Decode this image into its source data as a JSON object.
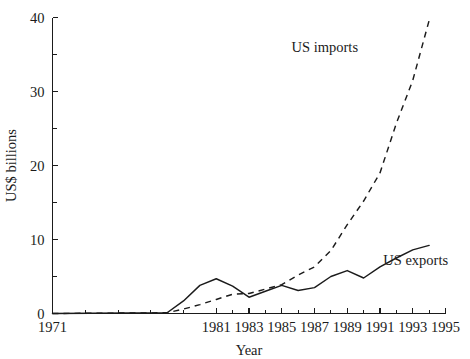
{
  "chart_data": {
    "type": "line",
    "title": "",
    "xlabel": "Year",
    "ylabel": "US$ billions",
    "xlim": [
      1971,
      1995
    ],
    "ylim": [
      0,
      40
    ],
    "grid": false,
    "legend_position": "inline-annotations",
    "x_ticks": [
      {
        "value": 1971,
        "label": "1971"
      },
      {
        "value": 1981,
        "label": "1981"
      },
      {
        "value": 1983,
        "label": "1983"
      },
      {
        "value": 1985,
        "label": "1985"
      },
      {
        "value": 1987,
        "label": "1987"
      },
      {
        "value": 1989,
        "label": "1989"
      },
      {
        "value": 1991,
        "label": "1991"
      },
      {
        "value": 1993,
        "label": "1993"
      },
      {
        "value": 1995,
        "label": "1995"
      }
    ],
    "x_minor_ticks": [
      1973,
      1975,
      1977,
      1979,
      1982,
      1984,
      1986,
      1988,
      1990,
      1992,
      1994
    ],
    "y_ticks": [
      {
        "value": 0,
        "label": "0"
      },
      {
        "value": 10,
        "label": "10"
      },
      {
        "value": 20,
        "label": "20"
      },
      {
        "value": 30,
        "label": "30"
      },
      {
        "value": 40,
        "label": "40"
      }
    ],
    "y_minor_ticks": [
      5,
      15,
      25,
      35
    ],
    "series": [
      {
        "name": "US imports",
        "style": "dashed",
        "color": "#1b1b1b",
        "label_text": "US imports",
        "label_x": 1985.6,
        "label_y": 35.4,
        "x": [
          1971,
          1978,
          1979,
          1980,
          1981,
          1982,
          1983,
          1984,
          1985,
          1986,
          1987,
          1988,
          1989,
          1990,
          1991,
          1992,
          1993,
          1994
        ],
        "values": [
          0,
          0.1,
          0.6,
          1.2,
          1.9,
          2.6,
          2.7,
          3.3,
          3.9,
          5.2,
          6.3,
          8.5,
          12.0,
          15.2,
          19.0,
          25.7,
          31.5,
          39.6
        ]
      },
      {
        "name": "US exports",
        "style": "solid",
        "color": "#1b1b1b",
        "label_text": "US exports",
        "label_x": 1991.2,
        "label_y": 6.6,
        "x": [
          1971,
          1978,
          1979,
          1980,
          1981,
          1982,
          1983,
          1984,
          1985,
          1986,
          1987,
          1988,
          1989,
          1990,
          1991,
          1992,
          1993,
          1994
        ],
        "values": [
          0,
          0.1,
          1.7,
          3.8,
          4.7,
          3.7,
          2.2,
          3.0,
          3.8,
          3.1,
          3.5,
          5.0,
          5.8,
          4.8,
          6.3,
          7.5,
          8.6,
          9.2
        ]
      }
    ]
  }
}
